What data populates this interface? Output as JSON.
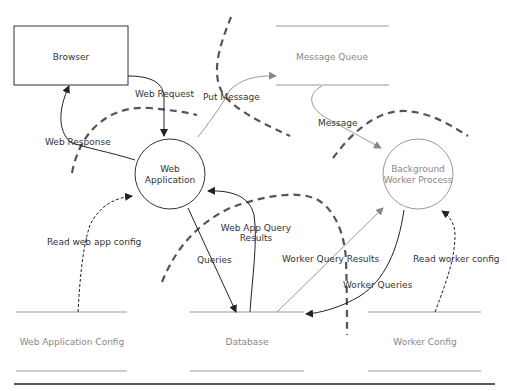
{
  "diagram": {
    "type": "data-flow-diagram",
    "colors": {
      "primary_stroke": "#333333",
      "secondary_stroke": "#999999",
      "boundary": "#555555",
      "background": "#ffffff"
    },
    "external_entities": [
      {
        "id": "browser",
        "label": "Browser"
      }
    ],
    "processes": [
      {
        "id": "web_app",
        "label_line1": "Web",
        "label_line2": "Application"
      },
      {
        "id": "worker",
        "label_line1": "Background",
        "label_line2": "Worker Process"
      }
    ],
    "data_stores": [
      {
        "id": "mq",
        "label": "Message Queue"
      },
      {
        "id": "webcfg",
        "label": "Web Application Config"
      },
      {
        "id": "db",
        "label": "Database"
      },
      {
        "id": "workercfg",
        "label": "Worker Config"
      }
    ],
    "flows": [
      {
        "from": "browser",
        "to": "web_app",
        "label": "Web Request"
      },
      {
        "from": "web_app",
        "to": "browser",
        "label": "Web Response"
      },
      {
        "from": "web_app",
        "to": "mq",
        "label": "Put Message"
      },
      {
        "from": "mq",
        "to": "worker",
        "label": "Message"
      },
      {
        "from": "webcfg",
        "to": "web_app",
        "label": "Read web app config"
      },
      {
        "from": "web_app",
        "to": "db",
        "label": "Queries"
      },
      {
        "from": "db",
        "to": "web_app",
        "label_line1": "Web App Query",
        "label_line2": "Results"
      },
      {
        "from": "db",
        "to": "worker",
        "label": "Worker Query Results"
      },
      {
        "from": "worker",
        "to": "db",
        "label": "Worker Queries"
      },
      {
        "from": "workercfg",
        "to": "worker",
        "label": "Read worker config"
      }
    ]
  }
}
